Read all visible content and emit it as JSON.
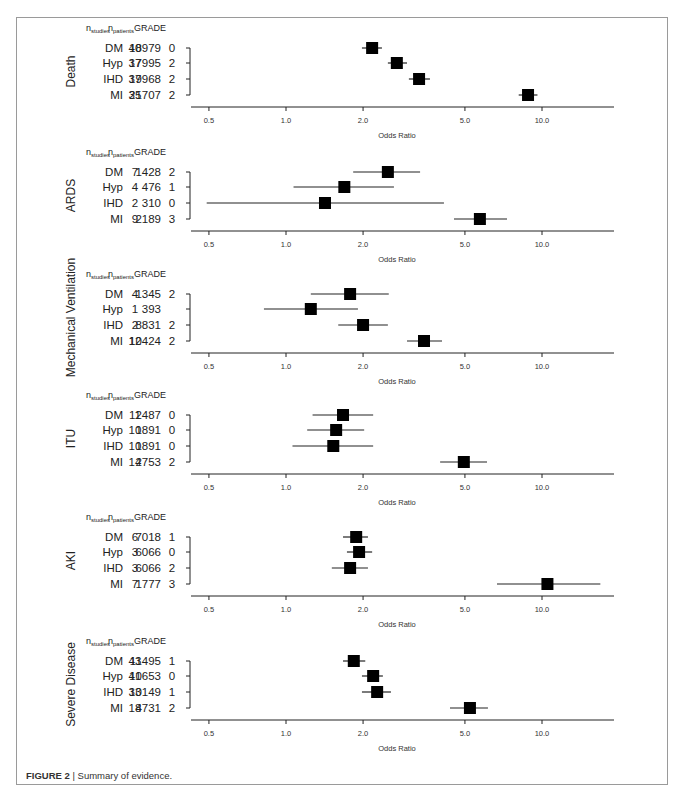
{
  "caption": {
    "figure_label": "FIGURE 2",
    "separator": " | ",
    "text": "Summary of evidence."
  },
  "chart_data": [
    {
      "type": "forest",
      "title": "Death",
      "xlabel": "Odds Ratio",
      "x_scale": "log",
      "xlim": [
        0.45,
        19
      ],
      "xticks": [
        0.5,
        1.0,
        2.0,
        5.0,
        10.0
      ],
      "xtick_labels": [
        "0.5",
        "1.0",
        "2.0",
        "5.0",
        "10.0"
      ],
      "columns": [
        "n_studies",
        "n_patients",
        "GRADE"
      ],
      "rows": [
        {
          "label": "DM",
          "n_studies": "40",
          "n_patients": "18979",
          "grade": "0",
          "or": 2.17,
          "ci_low": 1.98,
          "ci_high": 2.37
        },
        {
          "label": "Hyp",
          "n_studies": "37",
          "n_patients": "17995",
          "grade": "2",
          "or": 2.71,
          "ci_low": 2.5,
          "ci_high": 2.97
        },
        {
          "label": "IHD",
          "n_studies": "37",
          "n_patients": "19968",
          "grade": "2",
          "or": 3.31,
          "ci_low": 3.02,
          "ci_high": 3.65
        },
        {
          "label": "MI",
          "n_studies": "35",
          "n_patients": "21707",
          "grade": "2",
          "or": 8.82,
          "ci_low": 8.11,
          "ci_high": 9.6
        }
      ]
    },
    {
      "type": "forest",
      "title": "ARDS",
      "xlabel": "Odds Ratio",
      "x_scale": "log",
      "xlim": [
        0.45,
        19
      ],
      "xticks": [
        0.5,
        1.0,
        2.0,
        5.0,
        10.0
      ],
      "xtick_labels": [
        "0.5",
        "1.0",
        "2.0",
        "5.0",
        "10.0"
      ],
      "columns": [
        "n_studies",
        "n_patients",
        "GRADE"
      ],
      "rows": [
        {
          "label": "DM",
          "n_studies": "7",
          "n_patients": "1428",
          "grade": "2",
          "or": 2.5,
          "ci_low": 1.83,
          "ci_high": 3.34
        },
        {
          "label": "Hyp",
          "n_studies": "4",
          "n_patients": "476",
          "grade": "1",
          "or": 1.69,
          "ci_low": 1.07,
          "ci_high": 2.64
        },
        {
          "label": "IHD",
          "n_studies": "2",
          "n_patients": "310",
          "grade": "0",
          "or": 1.42,
          "ci_low": 0.49,
          "ci_high": 4.14
        },
        {
          "label": "MI",
          "n_studies": "9",
          "n_patients": "2189",
          "grade": "3",
          "or": 5.72,
          "ci_low": 4.53,
          "ci_high": 7.3
        }
      ]
    },
    {
      "type": "forest",
      "title": "Mechanical Ventilation",
      "xlabel": "Odds Ratio",
      "x_scale": "log",
      "xlim": [
        0.45,
        19
      ],
      "xticks": [
        0.5,
        1.0,
        2.0,
        5.0,
        10.0
      ],
      "xtick_labels": [
        "0.5",
        "1.0",
        "2.0",
        "5.0",
        "10.0"
      ],
      "columns": [
        "n_studies",
        "n_patients",
        "GRADE"
      ],
      "rows": [
        {
          "label": "DM",
          "n_studies": "4",
          "n_patients": "1345",
          "grade": "2",
          "or": 1.78,
          "ci_low": 1.25,
          "ci_high": 2.52
        },
        {
          "label": "Hyp",
          "n_studies": "1",
          "n_patients": "393",
          "grade": "",
          "or": 1.25,
          "ci_low": 0.82,
          "ci_high": 1.91
        },
        {
          "label": "IHD",
          "n_studies": "2",
          "n_patients": "8831",
          "grade": "2",
          "or": 2.0,
          "ci_low": 1.6,
          "ci_high": 2.5
        },
        {
          "label": "MI",
          "n_studies": "12",
          "n_patients": "10424",
          "grade": "2",
          "or": 3.46,
          "ci_low": 2.97,
          "ci_high": 4.07
        }
      ]
    },
    {
      "type": "forest",
      "title": "ITU",
      "xlabel": "Odds Ratio",
      "x_scale": "log",
      "xlim": [
        0.45,
        19
      ],
      "xticks": [
        0.5,
        1.0,
        2.0,
        5.0,
        10.0
      ],
      "xtick_labels": [
        "0.5",
        "1.0",
        "2.0",
        "5.0",
        "10.0"
      ],
      "columns": [
        "n_studies",
        "n_patients",
        "GRADE"
      ],
      "rows": [
        {
          "label": "DM",
          "n_studies": "11",
          "n_patients": "2487",
          "grade": "0",
          "or": 1.67,
          "ci_low": 1.27,
          "ci_high": 2.19
        },
        {
          "label": "Hyp",
          "n_studies": "10",
          "n_patients": "1891",
          "grade": "0",
          "or": 1.57,
          "ci_low": 1.21,
          "ci_high": 2.02
        },
        {
          "label": "IHD",
          "n_studies": "10",
          "n_patients": "1891",
          "grade": "0",
          "or": 1.53,
          "ci_low": 1.06,
          "ci_high": 2.19
        },
        {
          "label": "MI",
          "n_studies": "14",
          "n_patients": "2753",
          "grade": "2",
          "or": 4.95,
          "ci_low": 4.0,
          "ci_high": 6.1
        }
      ]
    },
    {
      "type": "forest",
      "title": "AKI",
      "xlabel": "Odds Ratio",
      "x_scale": "log",
      "xlim": [
        0.45,
        19
      ],
      "xticks": [
        0.5,
        1.0,
        2.0,
        5.0,
        10.0
      ],
      "xtick_labels": [
        "0.5",
        "1.0",
        "2.0",
        "5.0",
        "10.0"
      ],
      "columns": [
        "n_studies",
        "n_patients",
        "GRADE"
      ],
      "rows": [
        {
          "label": "DM",
          "n_studies": "6",
          "n_patients": "7018",
          "grade": "1",
          "or": 1.88,
          "ci_low": 1.67,
          "ci_high": 2.09
        },
        {
          "label": "Hyp",
          "n_studies": "3",
          "n_patients": "6066",
          "grade": "0",
          "or": 1.93,
          "ci_low": 1.73,
          "ci_high": 2.17
        },
        {
          "label": "IHD",
          "n_studies": "3",
          "n_patients": "6066",
          "grade": "2",
          "or": 1.78,
          "ci_low": 1.51,
          "ci_high": 2.09
        },
        {
          "label": "MI",
          "n_studies": "7",
          "n_patients": "1777",
          "grade": "3",
          "or": 10.5,
          "ci_low": 6.67,
          "ci_high": 16.9
        }
      ]
    },
    {
      "type": "forest",
      "title": "Severe Disease",
      "xlabel": "Odds Ratio",
      "x_scale": "log",
      "xlim": [
        0.45,
        19
      ],
      "xticks": [
        0.5,
        1.0,
        2.0,
        5.0,
        10.0
      ],
      "xtick_labels": [
        "0.5",
        "1.0",
        "2.0",
        "5.0",
        "10.0"
      ],
      "columns": [
        "n_studies",
        "n_patients",
        "GRADE"
      ],
      "rows": [
        {
          "label": "DM",
          "n_studies": "43",
          "n_patients": "11495",
          "grade": "1",
          "or": 1.84,
          "ci_low": 1.67,
          "ci_high": 2.04
        },
        {
          "label": "Hyp",
          "n_studies": "41",
          "n_patients": "10653",
          "grade": "0",
          "or": 2.19,
          "ci_low": 1.98,
          "ci_high": 2.39
        },
        {
          "label": "IHD",
          "n_studies": "33",
          "n_patients": "10149",
          "grade": "1",
          "or": 2.27,
          "ci_low": 1.98,
          "ci_high": 2.57
        },
        {
          "label": "MI",
          "n_studies": "18",
          "n_patients": "4731",
          "grade": "2",
          "or": 5.23,
          "ci_low": 4.37,
          "ci_high": 6.15
        }
      ]
    }
  ],
  "layout": {
    "panel_tops": [
      31,
      155,
      277,
      398,
      520,
      644
    ],
    "row_offsets": [
      17,
      32,
      48,
      64
    ],
    "axis_offset": 76,
    "tick_label_offset": 92,
    "xlabel_offset": 107,
    "x_at_or1": 286,
    "px_per_decade": 256,
    "axis_x_start": 191,
    "axis_x_end": 614,
    "bracket_x": 190,
    "col_label_x": 123,
    "col_studies_x": 135,
    "col_patients_x": 176,
    "col_grade_x": 172,
    "header_studies_x": 86,
    "header_patients_x": 108,
    "title_x": 75
  }
}
